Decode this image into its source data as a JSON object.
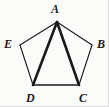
{
  "figure": {
    "kind": "geometry-diagram",
    "shape_name": "pentagon",
    "background_color": "#fbfbfa",
    "stroke_color": "#1a1a1a",
    "label_color": "#1a1a1a",
    "vertices": [
      {
        "id": "A",
        "label": "A",
        "x": 57,
        "y": 22,
        "label_position": "above"
      },
      {
        "id": "B",
        "label": "B",
        "x": 92,
        "y": 45,
        "label_position": "right"
      },
      {
        "id": "C",
        "label": "C",
        "x": 79,
        "y": 85,
        "label_position": "below"
      },
      {
        "id": "D",
        "label": "D",
        "x": 33,
        "y": 85,
        "label_position": "below"
      },
      {
        "id": "E",
        "label": "E",
        "x": 20,
        "y": 45,
        "label_position": "left"
      }
    ],
    "sides": [
      {
        "id": "AB",
        "from": "A",
        "to": "B",
        "weight": "thin",
        "stroke_width": 1.1
      },
      {
        "id": "BC",
        "from": "B",
        "to": "C",
        "weight": "thin",
        "stroke_width": 1.1
      },
      {
        "id": "CD",
        "from": "C",
        "to": "D",
        "weight": "medium",
        "stroke_width": 1.7
      },
      {
        "id": "DE",
        "from": "D",
        "to": "E",
        "weight": "thin",
        "stroke_width": 1.1
      },
      {
        "id": "EA",
        "from": "E",
        "to": "A",
        "weight": "thin",
        "stroke_width": 1.1
      }
    ],
    "diagonals": [
      {
        "id": "AD",
        "from": "A",
        "to": "D",
        "weight": "bold",
        "stroke_width": 2.6
      },
      {
        "id": "AC",
        "from": "A",
        "to": "C",
        "weight": "bold",
        "stroke_width": 2.6
      }
    ]
  }
}
